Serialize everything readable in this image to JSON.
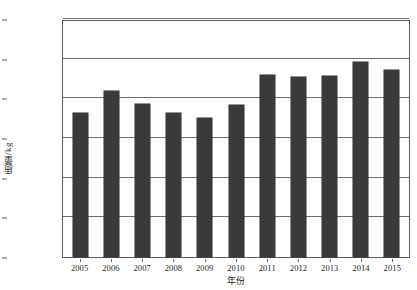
{
  "chart_data": {
    "type": "bar",
    "title": "",
    "xlabel": "年份",
    "ylabel": "质量/kg",
    "categories": [
      "2005",
      "2006",
      "2007",
      "2008",
      "2009",
      "2010",
      "2011",
      "2012",
      "2013",
      "2014",
      "2015"
    ],
    "values": [
      18100000,
      20900000,
      19300000,
      18100000,
      17500000,
      19100000,
      22900000,
      22700000,
      22800000,
      24600000,
      23600000
    ],
    "ylim": [
      0,
      30000000
    ],
    "ytick_values": [
      0,
      5000000,
      10000000,
      15000000,
      20000000,
      25000000,
      30000000
    ],
    "ytick_labels": [
      "0",
      "5 000 000",
      "10 000 000",
      "15 000 000",
      "20 000 000",
      "25 000 000",
      "30 000 000"
    ],
    "grid": true,
    "legend": false,
    "bar_color": "#3a3a3a",
    "axis_color": "#5d5d5d",
    "background": "#ffffff"
  }
}
